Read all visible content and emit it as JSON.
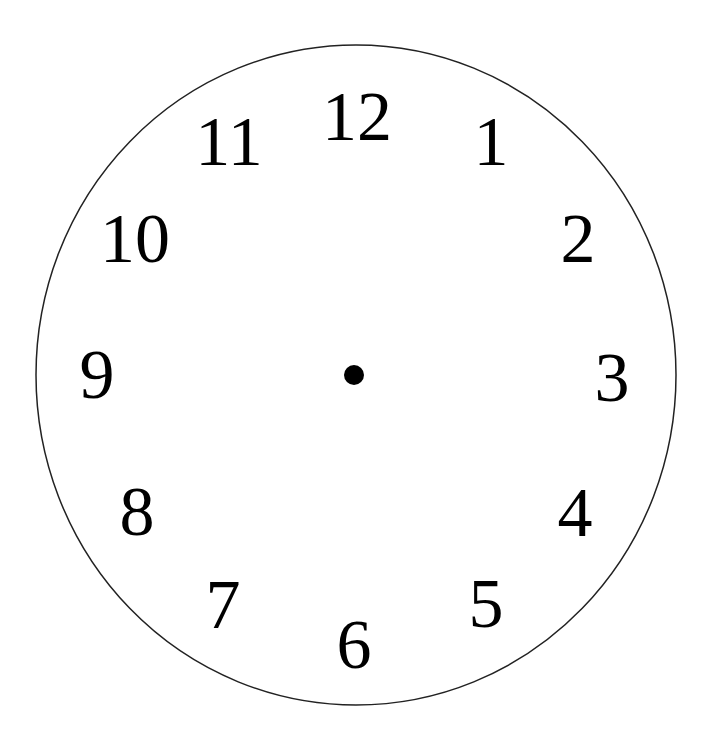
{
  "clock": {
    "face": {
      "cx": 356,
      "cy": 375,
      "rx": 320,
      "ry": 330,
      "stroke": "#222222",
      "fill": "#ffffff"
    },
    "center_dot": {
      "cx": 354,
      "cy": 375,
      "r": 10,
      "color": "#000000"
    },
    "font_size": 70,
    "numerals": [
      {
        "label": "12",
        "x": 357,
        "y": 140
      },
      {
        "label": "1",
        "x": 491,
        "y": 165
      },
      {
        "label": "2",
        "x": 578,
        "y": 262
      },
      {
        "label": "3",
        "x": 612,
        "y": 401
      },
      {
        "label": "4",
        "x": 575,
        "y": 536
      },
      {
        "label": "5",
        "x": 486,
        "y": 627
      },
      {
        "label": "6",
        "x": 354,
        "y": 668
      },
      {
        "label": "7",
        "x": 223,
        "y": 628
      },
      {
        "label": "8",
        "x": 137,
        "y": 535
      },
      {
        "label": "9",
        "x": 97,
        "y": 398
      },
      {
        "label": "10",
        "x": 135,
        "y": 262
      },
      {
        "label": "11",
        "x": 229,
        "y": 165
      }
    ]
  }
}
